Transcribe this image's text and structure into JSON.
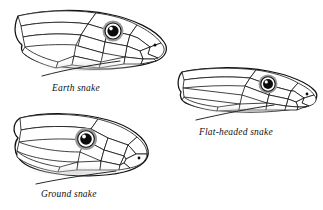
{
  "plate": {
    "background_color": "#ffffff",
    "ink_color": "#111111",
    "figure_count": 3
  },
  "figures": [
    {
      "id": "earth-snake",
      "caption": "Earth snake",
      "subject": "snake head in left profile",
      "head_shape": "tapered wedge, moderately deep, pointed snout",
      "has_leader_line": true,
      "eye": {
        "pupil_color": "#0b0b0b",
        "iris_ring_color": "#9a9a9a",
        "highlight": "white glint"
      },
      "nostril": "small dark dot near snout tip"
    },
    {
      "id": "flat-headed-snake",
      "caption": "Flat-headed snake",
      "subject": "snake head in left profile",
      "head_shape": "low and flattened, elongate, blunt-rounded snout",
      "has_leader_line": true,
      "eye": {
        "pupil_color": "#0b0b0b",
        "iris_ring_color": "#9a9a9a",
        "highlight": "white glint"
      },
      "nostril": "small dark dot near snout tip"
    },
    {
      "id": "ground-snake",
      "caption": "Ground snake",
      "subject": "snake head in left profile",
      "head_shape": "deep and rounded, short blunt snout",
      "has_leader_line": true,
      "eye": {
        "pupil_color": "#0b0b0b",
        "iris_ring_color": "#9a9a9a",
        "highlight": "white glint"
      },
      "nostril": "small dark dot near snout tip"
    }
  ]
}
